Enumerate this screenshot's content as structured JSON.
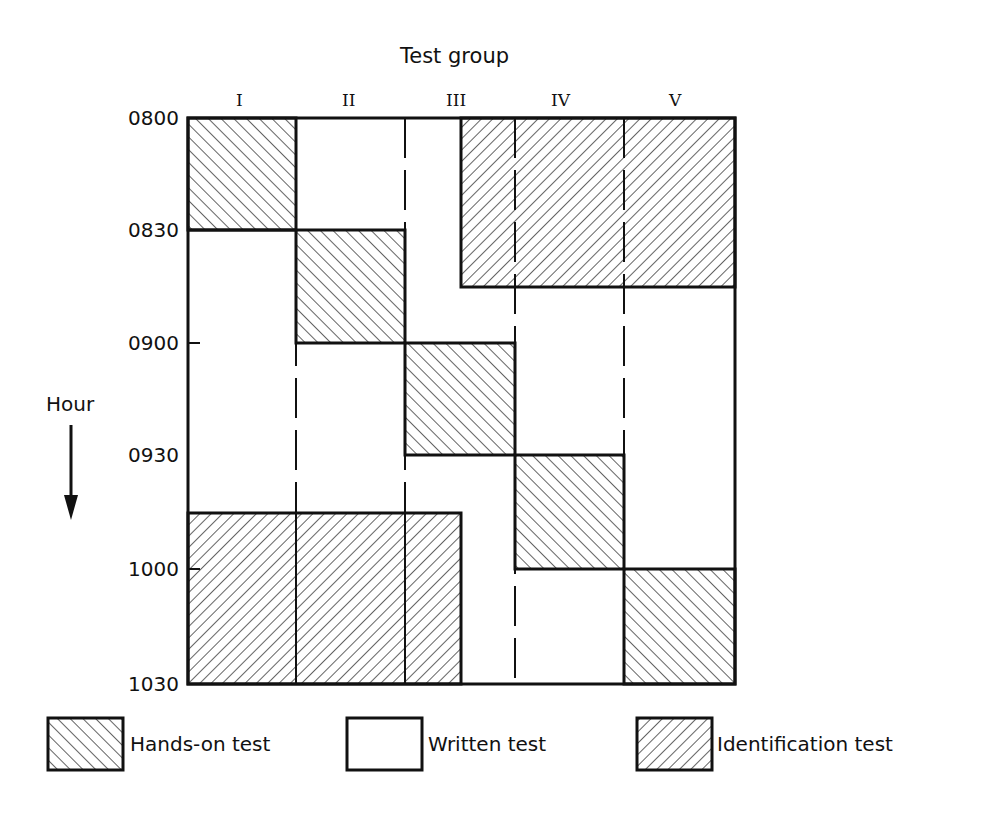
{
  "diagram": {
    "title": "Test group",
    "y_axis_label": "Hour",
    "groups": [
      "I",
      "II",
      "III",
      "IV",
      "V"
    ],
    "times": [
      "0800",
      "0830",
      "0900",
      "0930",
      "1000",
      "1030"
    ],
    "legend": [
      {
        "label": "Hands-on test",
        "pattern": "hatch-backslash"
      },
      {
        "label": "Written test",
        "pattern": "blank"
      },
      {
        "label": "Identification test",
        "pattern": "hatch-slash"
      }
    ],
    "blocks": [
      {
        "type": "Hands-on test",
        "groups": "I",
        "start": "0800",
        "end": "0830"
      },
      {
        "type": "Hands-on test",
        "groups": "II",
        "start": "0830",
        "end": "0900"
      },
      {
        "type": "Hands-on test",
        "groups": "III",
        "start": "0900",
        "end": "0930"
      },
      {
        "type": "Hands-on test",
        "groups": "IV",
        "start": "0930",
        "end": "1000"
      },
      {
        "type": "Hands-on test",
        "groups": "V",
        "start": "1000",
        "end": "1030"
      },
      {
        "type": "Identification test",
        "groups": "III(part)-V",
        "start": "0800",
        "end": "0845"
      },
      {
        "type": "Identification test",
        "groups": "I-III(part)",
        "start": "0945",
        "end": "1030"
      }
    ]
  }
}
